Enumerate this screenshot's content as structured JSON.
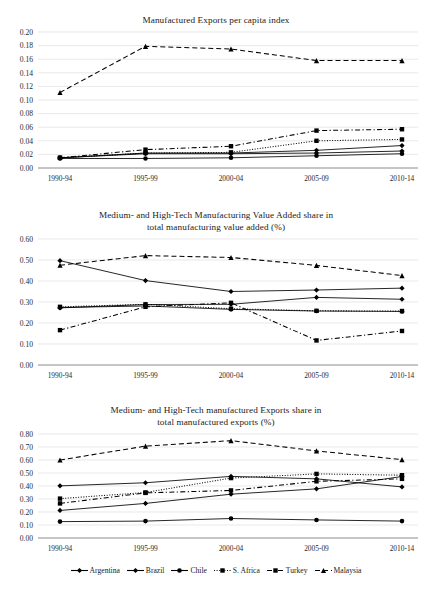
{
  "figure": {
    "background": "#ffffff",
    "series_color": "#000000"
  },
  "legend": {
    "position": "bottom-center",
    "items": [
      {
        "label": "Argentina",
        "key": "argentina-legend-key",
        "dash": "solid",
        "marker": "diamond"
      },
      {
        "label": "Brazil",
        "key": "brazil-legend-key",
        "dash": "solid",
        "marker": "diamond"
      },
      {
        "label": "Chile",
        "key": "chile-legend-key",
        "dash": "solid",
        "marker": "circle"
      },
      {
        "label": "S. Africa",
        "key": "s-africa-legend-key",
        "dash": "dotted",
        "marker": "square"
      },
      {
        "label": "Turkey",
        "key": "turkey-legend-key",
        "dash": "dashdot",
        "marker": "square"
      },
      {
        "label": "Malaysia",
        "key": "malaysia-legend-key",
        "dash": "dashed",
        "marker": "triangle"
      }
    ]
  },
  "chart_data": [
    {
      "id": "manufactured-exports-per-capita",
      "type": "line",
      "title": "Manufactured Exports per capita index",
      "xlabel": "",
      "ylabel": "",
      "categories": [
        "1990-94",
        "1995-99",
        "2000-04",
        "2005-09",
        "2010-14"
      ],
      "ylim": [
        0.0,
        0.2
      ],
      "ytick_step": 0.02,
      "ytick_labels": [
        "0.00",
        "0.02",
        "0.04",
        "0.06",
        "0.08",
        "0.10",
        "0.12",
        "0.14",
        "0.16",
        "0.18",
        "0.20"
      ],
      "grid": true,
      "legend_position": "shared-bottom",
      "series": [
        {
          "name": "Argentina",
          "dash": "solid",
          "marker": "diamond",
          "values": [
            0.015,
            0.021,
            0.021,
            0.022,
            0.025
          ]
        },
        {
          "name": "Brazil",
          "dash": "solid",
          "marker": "diamond",
          "values": [
            0.015,
            0.022,
            0.022,
            0.026,
            0.033
          ]
        },
        {
          "name": "Chile",
          "dash": "solid",
          "marker": "circle",
          "values": [
            0.014,
            0.014,
            0.015,
            0.018,
            0.021
          ]
        },
        {
          "name": "S. Africa",
          "dash": "dotted",
          "marker": "square",
          "values": [
            0.015,
            0.022,
            0.023,
            0.04,
            0.042
          ]
        },
        {
          "name": "Turkey",
          "dash": "dashdot",
          "marker": "square",
          "values": [
            0.015,
            0.027,
            0.032,
            0.055,
            0.057
          ]
        },
        {
          "name": "Malaysia",
          "dash": "dashed",
          "marker": "triangle",
          "values": [
            0.111,
            0.179,
            0.175,
            0.158,
            0.158
          ]
        }
      ]
    },
    {
      "id": "mht-manufacturing-value-added-share",
      "type": "line",
      "title": "Medium- and High-Tech Manufacturing Value Added share in total manufacturing value added (%)",
      "title_line1": "Medium- and High-Tech Manufacturing Value Added share in",
      "title_line2": "total manufacturing value added (%)",
      "xlabel": "",
      "ylabel": "",
      "categories": [
        "1990-94",
        "1995-99",
        "2000-04",
        "2005-09",
        "2010-14"
      ],
      "ylim": [
        0.0,
        0.6
      ],
      "ytick_step": 0.1,
      "ytick_labels": [
        "0.00",
        "0.10",
        "0.20",
        "0.30",
        "0.40",
        "0.50",
        "0.60"
      ],
      "grid": true,
      "legend_position": "shared-bottom",
      "series": [
        {
          "name": "Argentina",
          "dash": "solid",
          "marker": "diamond",
          "values": [
            0.497,
            0.402,
            0.35,
            0.357,
            0.366
          ]
        },
        {
          "name": "Brazil",
          "dash": "solid",
          "marker": "diamond",
          "values": [
            0.272,
            0.288,
            0.289,
            0.322,
            0.313
          ]
        },
        {
          "name": "Chile",
          "dash": "solid",
          "marker": "circle",
          "values": [
            0.274,
            0.281,
            0.265,
            0.257,
            0.255
          ]
        },
        {
          "name": "S. Africa",
          "dash": "dotted",
          "marker": "square",
          "values": [
            0.277,
            0.289,
            0.268,
            0.258,
            0.257
          ]
        },
        {
          "name": "Turkey",
          "dash": "dashdot",
          "marker": "square",
          "values": [
            0.166,
            0.277,
            0.296,
            0.117,
            0.162
          ]
        },
        {
          "name": "Malaysia",
          "dash": "dashed",
          "marker": "triangle",
          "values": [
            0.475,
            0.521,
            0.512,
            0.474,
            0.426
          ]
        }
      ]
    },
    {
      "id": "mht-manufactured-exports-share",
      "type": "line",
      "title": "Medium- and High-Tech manufactured Exports share in total manufactured exports (%)",
      "title_line1": "Medium- and High-Tech manufactured Exports share in",
      "title_line2": "total manufactured exports (%)",
      "xlabel": "",
      "ylabel": "",
      "categories": [
        "1990-94",
        "1995-99",
        "2000-04",
        "2005-09",
        "2010-14"
      ],
      "ylim": [
        0.0,
        0.8
      ],
      "ytick_step": 0.1,
      "ytick_labels": [
        "0.00",
        "0.10",
        "0.20",
        "0.30",
        "0.40",
        "0.50",
        "0.60",
        "0.70",
        "0.80"
      ],
      "grid": true,
      "legend_position": "shared-bottom",
      "series": [
        {
          "name": "Argentina",
          "dash": "solid",
          "marker": "diamond",
          "values": [
            0.212,
            0.266,
            0.337,
            0.378,
            0.473
          ]
        },
        {
          "name": "Brazil",
          "dash": "solid",
          "marker": "diamond",
          "values": [
            0.401,
            0.425,
            0.474,
            0.455,
            0.393
          ]
        },
        {
          "name": "Chile",
          "dash": "solid",
          "marker": "circle",
          "values": [
            0.126,
            0.13,
            0.15,
            0.139,
            0.13
          ]
        },
        {
          "name": "S. Africa",
          "dash": "dotted",
          "marker": "square",
          "values": [
            0.303,
            0.35,
            0.461,
            0.493,
            0.483
          ]
        },
        {
          "name": "Turkey",
          "dash": "dashdot",
          "marker": "square",
          "values": [
            0.266,
            0.347,
            0.366,
            0.436,
            0.455
          ]
        },
        {
          "name": "Malaysia",
          "dash": "dashed",
          "marker": "triangle",
          "values": [
            0.6,
            0.707,
            0.749,
            0.67,
            0.603
          ]
        }
      ]
    }
  ]
}
